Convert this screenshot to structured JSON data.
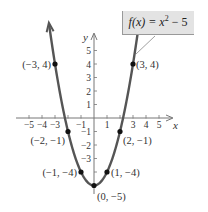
{
  "chart_data": {
    "type": "line",
    "equation_label": {
      "fx": "f(x) = x",
      "exp": "2",
      "tail": " − 5"
    },
    "xlabel": "x",
    "ylabel": "y",
    "xlim": [
      -5.5,
      5.5
    ],
    "ylim": [
      -5.5,
      5.5
    ],
    "x_ticks": [
      -5,
      -4,
      -3,
      -2,
      -1,
      1,
      2,
      3,
      4,
      5
    ],
    "x_tick_labels": [
      "−5",
      "−4",
      "−3",
      "",
      "−1",
      "1",
      "",
      "3",
      "4",
      "5"
    ],
    "y_ticks": [
      5,
      4,
      3,
      2,
      1,
      -1,
      -2,
      -3,
      -4
    ],
    "y_tick_labels": [
      "5",
      "4",
      "3",
      "2",
      "1",
      "−1",
      "−2",
      "−3",
      ""
    ],
    "grid": false,
    "function": "x^2 - 5",
    "points": [
      {
        "x": -3,
        "y": 4,
        "label": "(−3, 4)"
      },
      {
        "x": 3,
        "y": 4,
        "label": "(3, 4)"
      },
      {
        "x": -2,
        "y": -1,
        "label": "(−2, −1)"
      },
      {
        "x": 2,
        "y": -1,
        "label": "(2, −1)"
      },
      {
        "x": -1,
        "y": -4,
        "label": "(−1, −4)"
      },
      {
        "x": 1,
        "y": -4,
        "label": "(1, −4)"
      },
      {
        "x": 0,
        "y": -5,
        "label": "(0, −5)"
      }
    ],
    "colors": {
      "curve": "#555555",
      "axis": "#777777",
      "point": "#111111",
      "label_box": "#e3e3e3"
    }
  }
}
